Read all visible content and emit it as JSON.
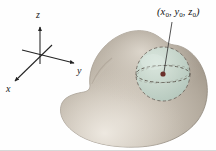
{
  "figure": {
    "background_color": "#fefefe"
  },
  "axes": {
    "origin": {
      "x": 40,
      "y": 55
    },
    "labels": {
      "x": "x",
      "y": "y",
      "z": "z"
    },
    "axis_color": "#2b2b2b"
  },
  "solid": {
    "name": "solid-region",
    "fill_light": "#d7d0c6",
    "fill_mid": "#b3aa9e",
    "fill_dark": "#8e8578",
    "outline_color": "#7d7467"
  },
  "sphere": {
    "name": "interior-sphere",
    "center": {
      "x": 163,
      "y": 74
    },
    "radius": 27,
    "fill_color": "#c6d9cf",
    "dash_color": "#6f6a62",
    "equator_color": "#5e594f"
  },
  "point": {
    "label": "(x0, y0, z0)",
    "label_parts": {
      "open": "(",
      "x": "x",
      "x_sub": "0",
      "sep1": ", ",
      "y": "y",
      "y_sub": "0",
      "sep2": ", ",
      "z": "z",
      "z_sub": "0",
      "close": ")"
    },
    "marker_color": "#6b2f2a",
    "leader_color": "#4a4a4a"
  }
}
